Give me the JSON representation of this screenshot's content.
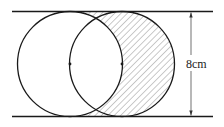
{
  "figure": {
    "type": "geometry-diagram",
    "dimension_label": "8cm",
    "colors": {
      "stroke": "#1a1a1a",
      "hatch": "#7a7a7a",
      "background": "#ffffff"
    },
    "geometry": {
      "top_line_y": 11.5,
      "bottom_line_y": 116.5,
      "line_x_start": 12,
      "line_x_end": 213,
      "circle_radius": 52.5,
      "left_circle_center": [
        70,
        64
      ],
      "right_circle_center": [
        122,
        64
      ],
      "dimension_arrow_x": 191
    },
    "points": [
      {
        "name": "left-center-point",
        "x": 70,
        "y": 64
      },
      {
        "name": "right-center-point",
        "x": 122,
        "y": 64
      }
    ]
  }
}
